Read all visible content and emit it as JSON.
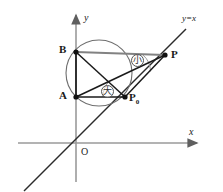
{
  "figure": {
    "type": "geometry-diagram",
    "width": 223,
    "height": 192,
    "background": "#ffffff"
  },
  "axes": {
    "x_label": "x",
    "y_label": "y",
    "origin_label": "O",
    "x_axis": {
      "from": [
        18,
        143
      ],
      "to": [
        200,
        143
      ],
      "color": "#8c8c8c"
    },
    "y_axis": {
      "from": [
        76,
        180
      ],
      "to": [
        76,
        12
      ],
      "color": "#8c8c8c"
    }
  },
  "lines": [
    {
      "name": "identity-line",
      "label": "y=x",
      "from": [
        24,
        191
      ],
      "to": [
        186,
        29
      ],
      "color": "#2b2b2b"
    }
  ],
  "circle": {
    "name": "circumcircle",
    "cx": 99,
    "cy": 73,
    "r": 33,
    "stroke": "#6f6f6f"
  },
  "points": [
    {
      "name": "B",
      "label": "B",
      "x": 76,
      "y": 52,
      "label_x": 60,
      "label_y": 46
    },
    {
      "name": "A",
      "label": "A",
      "x": 76,
      "y": 97,
      "label_x": 60,
      "label_y": 92
    },
    {
      "name": "P0",
      "label": "P",
      "sub": "0",
      "x": 125,
      "y": 97,
      "label_x": 130,
      "label_y": 93
    },
    {
      "name": "P",
      "label": "P",
      "x": 165,
      "y": 55,
      "label_x": 171,
      "label_y": 52
    }
  ],
  "segments": [
    {
      "name": "segment-B-P",
      "from": [
        76,
        52
      ],
      "to": [
        165,
        55
      ],
      "color": "#808080",
      "width": 2
    },
    {
      "name": "segment-A-P0",
      "from": [
        76,
        97
      ],
      "to": [
        125,
        97
      ],
      "color": "#1a1a1a",
      "width": 1.6
    },
    {
      "name": "segment-A-B",
      "from": [
        76,
        52
      ],
      "to": [
        76,
        97
      ],
      "color": "#1a1a1a",
      "width": 1.6
    },
    {
      "name": "segment-B-P0",
      "from": [
        76,
        52
      ],
      "to": [
        125,
        97
      ],
      "color": "#1a1a1a",
      "width": 1.4
    },
    {
      "name": "segment-A-P",
      "from": [
        76,
        97
      ],
      "to": [
        165,
        55
      ],
      "color": "#1a1a1a",
      "width": 1.4
    },
    {
      "name": "segment-P0-P",
      "from": [
        125,
        97
      ],
      "to": [
        165,
        55
      ],
      "color": "#1a1a1a",
      "width": 1.4
    }
  ],
  "angle_badges": [
    {
      "name": "angle-small",
      "text": "小",
      "x": 131,
      "y": 54,
      "meaning": "small angle at P"
    },
    {
      "name": "angle-large",
      "text": "大",
      "x": 101,
      "y": 85,
      "meaning": "large angle at P0"
    }
  ],
  "arcs": [
    {
      "name": "arc-at-P",
      "cx": 165,
      "cy": 55,
      "r": 22,
      "start_deg": 182,
      "end_deg": 228
    },
    {
      "name": "arc-at-P0",
      "cx": 125,
      "cy": 97,
      "r": 22,
      "start_deg": 180,
      "end_deg": 224
    }
  ]
}
